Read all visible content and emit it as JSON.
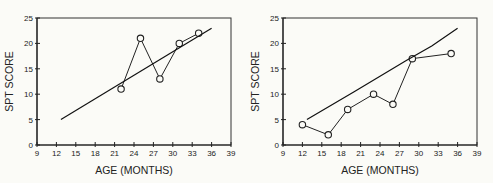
{
  "chart_data": [
    {
      "type": "line",
      "title": "",
      "xlabel": "AGE (MONTHS)",
      "ylabel": "SPT SCORE",
      "xlim": [
        9,
        39
      ],
      "ylim": [
        0,
        25
      ],
      "xticks": [
        9,
        12,
        15,
        18,
        21,
        24,
        27,
        30,
        33,
        36,
        39
      ],
      "yticks": [
        0,
        5,
        10,
        15,
        20,
        25
      ],
      "grid": false,
      "series": [
        {
          "name": "observed",
          "marker": "circle",
          "x": [
            22,
            25,
            28,
            31,
            34
          ],
          "y": [
            11,
            21,
            13,
            20,
            22
          ]
        },
        {
          "name": "trend",
          "marker": "none",
          "x": [
            12.7,
            36
          ],
          "y": [
            5,
            23
          ]
        }
      ]
    },
    {
      "type": "line",
      "title": "",
      "xlabel": "AGE (MONTHS)",
      "ylabel": "SPT SCORE",
      "xlim": [
        9,
        39
      ],
      "ylim": [
        0,
        25
      ],
      "xticks": [
        9,
        12,
        15,
        18,
        21,
        24,
        27,
        30,
        33,
        36,
        39
      ],
      "yticks": [
        0,
        5,
        10,
        15,
        20,
        25
      ],
      "grid": false,
      "series": [
        {
          "name": "observed",
          "marker": "circle",
          "x": [
            12,
            16,
            19,
            23,
            26,
            29,
            35
          ],
          "y": [
            4,
            2,
            7,
            10,
            8,
            17,
            18
          ]
        },
        {
          "name": "trend",
          "marker": "none",
          "x": [
            12.7,
            20,
            28,
            32,
            36
          ],
          "y": [
            5,
            10.5,
            16.6,
            19.5,
            23
          ]
        }
      ]
    }
  ],
  "colors": {
    "background": "#fbfbf7",
    "ink": "#222222"
  }
}
